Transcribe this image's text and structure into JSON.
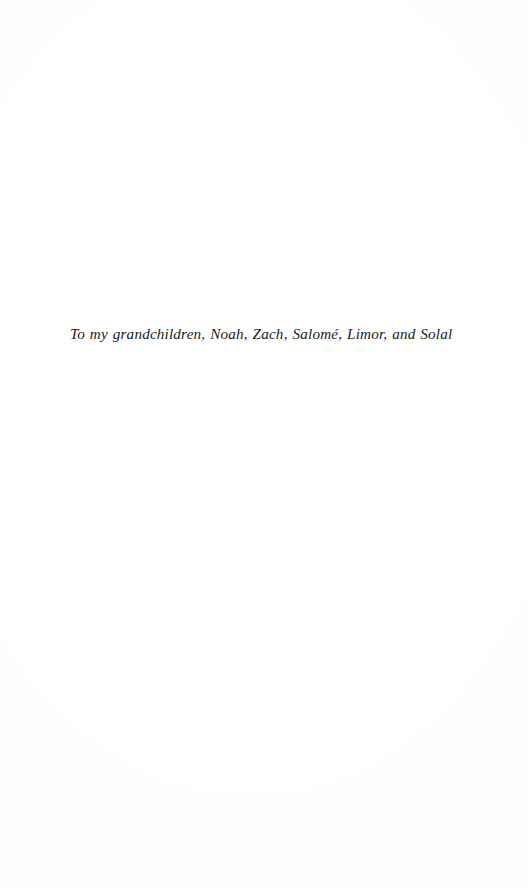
{
  "page": {
    "kind": "book-dedication-page",
    "background_color": "#ffffff",
    "text_color": "#1c1a19",
    "width": 528,
    "height": 888
  },
  "dedication": {
    "text": "To my grandchildren, Noah, Zach, Salomé, Limor, and Solal",
    "style": "italic-serif",
    "names": [
      "Noah",
      "Zach",
      "Salomé",
      "Limor",
      "Solal"
    ]
  }
}
